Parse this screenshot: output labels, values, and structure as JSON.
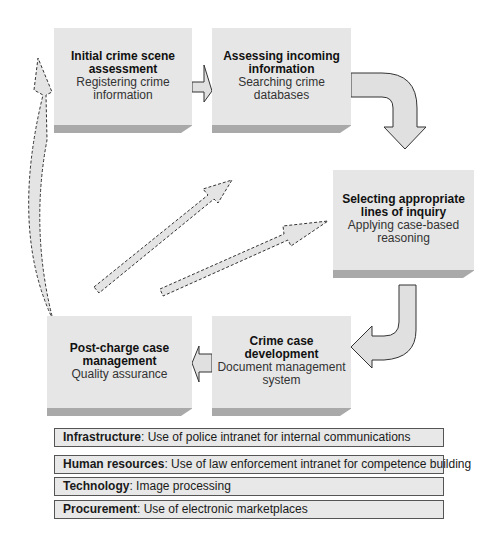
{
  "diagram": {
    "type": "process-flow-value-chain",
    "primary_activities": [
      {
        "id": "initial",
        "title": "Initial crime scene assessment",
        "title_lines": [
          "Initial crime scene",
          "assessment"
        ],
        "subtitle_lines": [
          "Registering crime",
          "information"
        ]
      },
      {
        "id": "assessing",
        "title": "Assessing incoming information",
        "title_lines": [
          "Assessing incoming",
          "information"
        ],
        "subtitle_lines": [
          "Searching crime",
          "databases"
        ]
      },
      {
        "id": "selecting",
        "title": "Selecting appropriate lines of inquiry",
        "title_lines": [
          "Selecting appropriate",
          "lines of inquiry"
        ],
        "subtitle_lines": [
          "Applying case-based",
          "reasoning"
        ]
      },
      {
        "id": "development",
        "title": "Crime case development",
        "title_lines": [
          "Crime case development"
        ],
        "subtitle_lines": [
          "Document management",
          "system"
        ]
      },
      {
        "id": "postcharge",
        "title": "Post-charge case management",
        "title_lines": [
          "Post-charge case",
          "management"
        ],
        "subtitle_lines": [
          "Quality assurance"
        ]
      }
    ],
    "flows": [
      {
        "from": "initial",
        "to": "assessing",
        "style": "solid"
      },
      {
        "from": "assessing",
        "to": "selecting",
        "style": "solid-curved"
      },
      {
        "from": "selecting",
        "to": "development",
        "style": "solid-curved"
      },
      {
        "from": "development",
        "to": "postcharge",
        "style": "solid"
      },
      {
        "from": "postcharge",
        "to": "initial",
        "style": "dashed-curved"
      },
      {
        "from": "postcharge",
        "to": "assessing",
        "style": "dashed"
      },
      {
        "from": "postcharge",
        "to": "selecting",
        "style": "dashed"
      }
    ],
    "support_activities": [
      {
        "label": "Infrastructure",
        "text": ": Use of police intranet for internal communications"
      },
      {
        "label": "Human resources",
        "text": ": Use of law enforcement intranet for competence building"
      },
      {
        "label": "Technology",
        "text": ": Image processing"
      },
      {
        "label": "Procurement",
        "text": ": Use of electronic marketplaces"
      }
    ],
    "colors": {
      "box_fill": "#e6e6e6",
      "box_shade": "#a9a9a9",
      "arrow_fill": "#e0e0e0",
      "outline": "#333333"
    }
  }
}
